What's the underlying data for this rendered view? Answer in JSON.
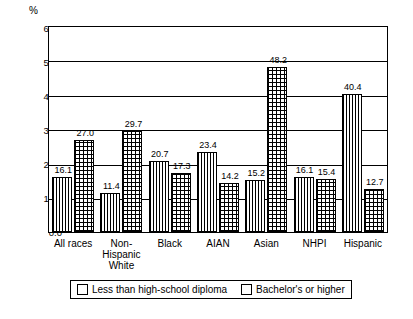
{
  "chart_data": {
    "type": "bar",
    "title": "",
    "subtitle": "",
    "xlabel": "",
    "ylabel": "%",
    "ylim": [
      0,
      60
    ],
    "yticks": [
      "0.0",
      "10.0",
      "20.0",
      "30.0",
      "40.0",
      "50.0",
      "60.0"
    ],
    "grid": true,
    "legend_position": "bottom",
    "categories": [
      "All races",
      "Non-Hispanic White",
      "Black",
      "AIAN",
      "Asian",
      "NHPI",
      "Hispanic"
    ],
    "category_lines": [
      [
        "All races"
      ],
      [
        "Non-",
        "Hispanic",
        "White"
      ],
      [
        "Black"
      ],
      [
        "AIAN"
      ],
      [
        "Asian"
      ],
      [
        "NHPI"
      ],
      [
        "Hispanic"
      ]
    ],
    "series": [
      {
        "name": "Less than high-school diploma",
        "pattern": "vertical-lines",
        "values": [
          16.1,
          11.4,
          20.7,
          23.4,
          15.2,
          16.1,
          40.4
        ],
        "labels": [
          "16.1",
          "11.4",
          "20.7",
          "23.4",
          "15.2",
          "16.1",
          "40.4"
        ]
      },
      {
        "name": "Bachelor's or higher",
        "pattern": "cross-hatch",
        "values": [
          27.0,
          29.7,
          17.3,
          14.2,
          48.2,
          15.4,
          12.7
        ],
        "labels": [
          "27.0",
          "29.7",
          "17.3",
          "14.2",
          "48.2",
          "15.4",
          "12.7"
        ]
      }
    ]
  },
  "legend": {
    "items": [
      {
        "label": "Less than high-school diploma"
      },
      {
        "label": "Bachelor's or higher"
      }
    ]
  }
}
